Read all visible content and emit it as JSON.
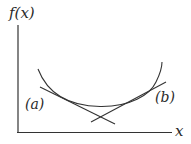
{
  "diagram": {
    "axes": {
      "y_label": "f(x)",
      "x_label": "x"
    },
    "tangents": [
      {
        "id": "a",
        "label": "(a)"
      },
      {
        "id": "b",
        "label": "(b)"
      }
    ],
    "colors": {
      "stroke": "#333333",
      "background": "#ffffff"
    }
  }
}
